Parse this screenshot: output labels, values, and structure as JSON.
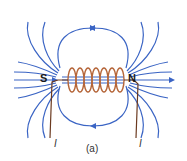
{
  "diagram": {
    "poles": {
      "south": "S",
      "north": "N"
    },
    "current_labels": [
      "I",
      "I"
    ],
    "caption": "(a)",
    "colors": {
      "field_lines": "#3a64c4",
      "coil": "#b5663a",
      "wire": "#6b3a20",
      "text": "#1a1a1a"
    }
  }
}
